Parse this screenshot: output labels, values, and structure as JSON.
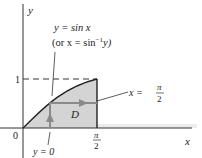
{
  "diagram": {
    "type": "region-of-integration",
    "axes": {
      "x_label": "x",
      "y_label": "y",
      "origin_label": "0"
    },
    "ticks": {
      "y_one": "1",
      "x_pi_over_2_num": "π",
      "x_pi_over_2_den": "2"
    },
    "curve": {
      "label_line1": "y = sin x",
      "label_line2_prefix": "(or x = sin",
      "label_line2_sup": "−1",
      "label_line2_suffix": "y)"
    },
    "region_label": "D",
    "boundaries": {
      "right_prefix": "x = ",
      "right_num": "π",
      "right_den": "2",
      "bottom": "y = 0"
    },
    "colors": {
      "region_fill": "#d4d4d4",
      "arrow": "#8a8a8a",
      "axis": "#333333",
      "curve": "#222222"
    }
  }
}
